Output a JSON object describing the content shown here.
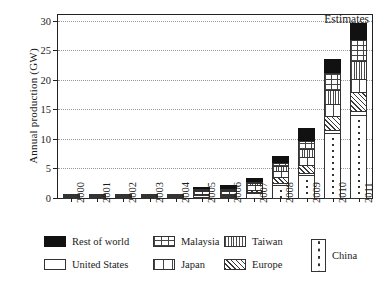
{
  "chart_data": {
    "type": "bar",
    "title": "",
    "xlabel": "",
    "ylabel": "Annual production (GW)",
    "ylim": [
      0,
      31
    ],
    "yticks": [
      0,
      5,
      10,
      15,
      20,
      25,
      30
    ],
    "grid": true,
    "stacked": true,
    "legend_position": "bottom",
    "annotation": "Estimates",
    "categories": [
      "2000",
      "2001",
      "2002",
      "2003",
      "2004",
      "2005",
      "2006",
      "2007",
      "2008",
      "2009",
      "2010",
      "2011"
    ],
    "series": [
      {
        "name": "China",
        "pattern": "dotted-vertical-line",
        "values": [
          0.0,
          0.0,
          0.0,
          0.0,
          0.0,
          0.1,
          0.4,
          1.0,
          2.4,
          4.0,
          11.2,
          14.2
        ]
      },
      {
        "name": "United States",
        "pattern": "solid-white",
        "values": [
          0.1,
          0.3,
          0.3,
          0.3,
          0.3,
          0.4,
          0.3,
          0.3,
          0.4,
          0.5,
          0.6,
          0.8
        ]
      },
      {
        "name": "Europe",
        "pattern": "diagonal-hatch",
        "values": [
          0.1,
          0.2,
          0.2,
          0.2,
          0.2,
          0.4,
          0.4,
          0.5,
          1.2,
          1.6,
          2.6,
          3.4
        ]
      },
      {
        "name": "Japan",
        "pattern": "vertical-wide-grid",
        "values": [
          0.1,
          0.2,
          0.3,
          0.3,
          0.3,
          0.7,
          0.7,
          0.9,
          1.2,
          1.4,
          2.1,
          2.4
        ]
      },
      {
        "name": "Taiwan",
        "pattern": "vertical-stripes",
        "values": [
          0.0,
          0.0,
          0.0,
          0.0,
          0.0,
          0.2,
          0.3,
          0.5,
          0.9,
          1.5,
          2.5,
          3.1
        ]
      },
      {
        "name": "Malaysia",
        "pattern": "grid",
        "values": [
          0.0,
          0.0,
          0.0,
          0.0,
          0.0,
          0.1,
          0.2,
          0.4,
          0.8,
          1.6,
          3.1,
          3.8
        ]
      },
      {
        "name": "Rest of world",
        "pattern": "solid-black",
        "values": [
          0.0,
          0.0,
          0.0,
          0.0,
          0.0,
          0.2,
          0.6,
          0.6,
          1.2,
          2.1,
          2.4,
          2.8
        ]
      }
    ],
    "totals": [
      0.3,
      0.7,
      0.8,
      0.8,
      0.8,
      2.1,
      2.9,
      4.2,
      8.1,
      12.7,
      24.5,
      30.5
    ]
  },
  "legend": {
    "items": [
      {
        "label": "Rest of world",
        "key": "rest"
      },
      {
        "label": "United States",
        "key": "us"
      },
      {
        "label": "Malaysia",
        "key": "malaysia"
      },
      {
        "label": "Japan",
        "key": "japan"
      },
      {
        "label": "Taiwan",
        "key": "taiwan"
      },
      {
        "label": "Europe",
        "key": "europe"
      },
      {
        "label": "China",
        "key": "china"
      }
    ]
  }
}
